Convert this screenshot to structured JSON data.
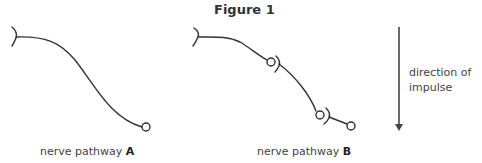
{
  "figure": {
    "title": "Figure 1"
  },
  "pathways": [
    {
      "label_prefix": "nerve pathway ",
      "label_letter": "A"
    },
    {
      "label_prefix": "nerve pathway ",
      "label_letter": "B"
    }
  ],
  "arrow": {
    "label_line1": "direction of",
    "label_line2": "impulse"
  }
}
